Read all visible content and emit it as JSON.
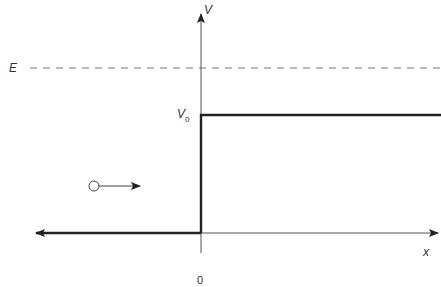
{
  "diagram": {
    "type": "potential-step",
    "labels": {
      "y_axis": "V",
      "x_axis": "x",
      "energy": "E",
      "step_height": "V",
      "step_height_subscript": "0",
      "origin": "0"
    },
    "elements": {
      "energy_line": {
        "style": "dashed",
        "level": "E"
      },
      "potential": {
        "left_region": "0",
        "right_region": "V0",
        "step_at": "x = 0"
      },
      "particle": {
        "shape": "open-circle",
        "direction": "right"
      }
    },
    "colors": {
      "line": "#333333",
      "dashed": "#777777",
      "background": "#ffffff"
    }
  }
}
